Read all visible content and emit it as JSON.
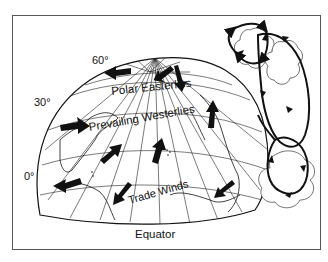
{
  "figure": {
    "latitude_labels": {
      "lat60": "60°",
      "lat30": "30°",
      "lat0": "0°"
    },
    "wind_labels": {
      "polar": "Polar Easterlies",
      "westerlies": "Prevailing Westerlies",
      "trade": "Trade Winds"
    },
    "equator_label": "Equator",
    "colors": {
      "ink": "#111111",
      "frame": "#555555",
      "background": "#ffffff"
    }
  }
}
